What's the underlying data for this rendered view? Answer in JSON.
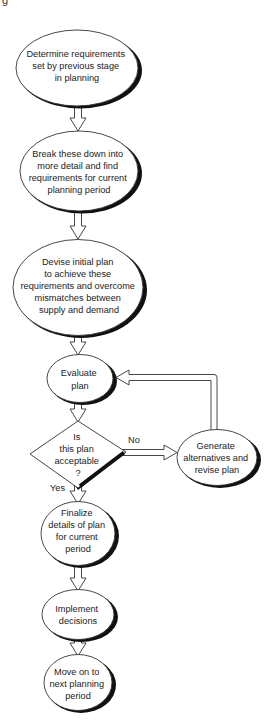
{
  "page": {
    "corner_fragment": "g"
  },
  "colors": {
    "stroke": "#333333",
    "shadow": "#111111",
    "fill": "#ffffff",
    "text": "#222222"
  },
  "nodes": {
    "determine": {
      "shape": "ellipse",
      "lines": [
        "Determine requirements",
        "set by previous stage",
        "in planning"
      ]
    },
    "breakdown": {
      "shape": "ellipse",
      "lines": [
        "Break these down into",
        "more detail and find",
        "requirements for current",
        "planning period"
      ]
    },
    "devise": {
      "shape": "ellipse",
      "lines": [
        "Devise initial plan",
        "to achieve these",
        "requirements and overcome",
        "mismatches between",
        "supply and demand"
      ]
    },
    "evaluate": {
      "shape": "ellipse",
      "lines": [
        "Evaluate",
        "plan"
      ]
    },
    "decision": {
      "shape": "diamond",
      "lines": [
        "Is",
        "this plan",
        "acceptable",
        "?"
      ]
    },
    "generate": {
      "shape": "ellipse",
      "lines": [
        "Generate",
        "alternatives and",
        "revise plan"
      ]
    },
    "finalize": {
      "shape": "ellipse",
      "lines": [
        "Finalize",
        "details of plan",
        "for current",
        "period"
      ]
    },
    "implement": {
      "shape": "ellipse",
      "lines": [
        "Implement",
        "decisions"
      ]
    },
    "moveon": {
      "shape": "ellipse",
      "lines": [
        "Move on to",
        "next planning",
        "period"
      ]
    }
  },
  "edges": {
    "no_label": "No",
    "yes_label": "Yes"
  }
}
